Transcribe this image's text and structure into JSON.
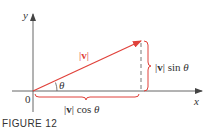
{
  "figure": {
    "caption": "FIGURE 12",
    "colors": {
      "vector": "#e0413a",
      "axes": "#555555",
      "text": "#333333",
      "dashed": "#555555"
    },
    "axes": {
      "x_label": "x",
      "y_label": "y",
      "origin_label": "0"
    },
    "vector": {
      "magnitude_label_bar_left": "|",
      "magnitude_label_symbol": "v",
      "magnitude_label_bar_right": "|"
    },
    "angle": {
      "label": "θ"
    },
    "vertical_component": {
      "bar_left": "|",
      "symbol": "v",
      "bar_right": "|",
      "func": "sin",
      "var": "θ"
    },
    "horizontal_component": {
      "bar_left": "|",
      "symbol": "v",
      "bar_right": "|",
      "func": "cos",
      "var": "θ"
    }
  }
}
